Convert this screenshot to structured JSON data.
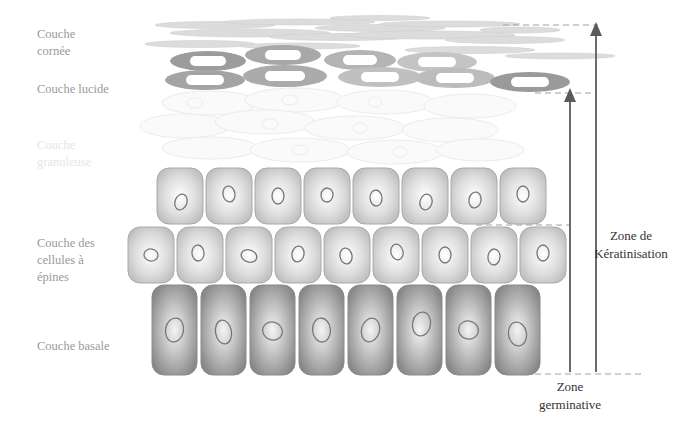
{
  "diagram": {
    "layers": [
      {
        "id": "cornee",
        "label_lines": [
          "Couche",
          "cornée"
        ]
      },
      {
        "id": "lucide",
        "label_lines": [
          "Couche lucide"
        ]
      },
      {
        "id": "granuleuse",
        "label_lines": [
          "Couche",
          "granuleuse"
        ]
      },
      {
        "id": "epines",
        "label_lines": [
          "Couche des",
          "cellules à",
          "épines"
        ]
      },
      {
        "id": "basale",
        "label_lines": [
          "Couche basale"
        ]
      }
    ],
    "zones": [
      {
        "id": "keratinisation",
        "label_lines": [
          "Zone de",
          "Kératinisation"
        ]
      },
      {
        "id": "germinative",
        "label_lines": [
          "Zone",
          "germinative"
        ]
      }
    ],
    "cell_counts": {
      "basale": 8,
      "epines_lower": 9,
      "epines_upper": 8
    },
    "colors": {
      "label_gray": "#9a9a9a",
      "label_faint": "#e6e6e6",
      "zone_text": "#333333",
      "arrow": "#666666",
      "dashed": "#999999",
      "basal_cell_dark": "#8c8c8c",
      "spiny_cell": "#c8c8c8",
      "lucid_ring": "#9c9c9c",
      "corneal_streak": "#d6d6d6"
    }
  }
}
